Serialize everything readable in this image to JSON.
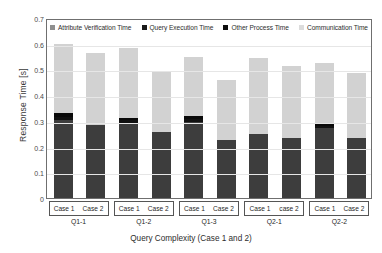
{
  "chart_data": {
    "type": "bar",
    "stacked": true,
    "title": "",
    "xlabel": "Query Complexity (Case 1 and 2)",
    "ylabel": "Response Time [s]",
    "ylim": [
      0,
      0.7
    ],
    "ytick_labels": [
      "0",
      "0.1",
      "0.2",
      "0.3",
      "0.4",
      "0.5",
      "0.6",
      "0.7"
    ],
    "ytick_values": [
      0,
      0.1,
      0.2,
      0.3,
      0.4,
      0.5,
      0.6,
      0.7
    ],
    "grid": true,
    "legend_position": "top-inside",
    "groups": [
      {
        "name": "Q1-1",
        "cases": [
          "Case 1",
          "Case 2"
        ]
      },
      {
        "name": "Q1-2",
        "cases": [
          "Case 1",
          "Case 2"
        ]
      },
      {
        "name": "Q1-3",
        "cases": [
          "Case 1",
          "Case 2"
        ]
      },
      {
        "name": "Q2-1",
        "cases": [
          "Case 1",
          "case 2"
        ]
      },
      {
        "name": "Q2-2",
        "cases": [
          "Case 1",
          "Case 2"
        ]
      }
    ],
    "categories": [
      "Q1-1 Case 1",
      "Q1-1 Case 2",
      "Q1-2 Case 1",
      "Q1-2 Case 2",
      "Q1-3 Case 1",
      "Q1-3 Case 2",
      "Q2-1 Case 1",
      "Q2-1 case 2",
      "Q2-2 Case 1",
      "Q2-2 Case 2"
    ],
    "series": [
      {
        "name": "Attribute Verification Time",
        "color": "#3d3d3d",
        "values": [
          0.305,
          0.285,
          0.292,
          0.255,
          0.295,
          0.225,
          0.25,
          0.235,
          0.272,
          0.235
        ]
      },
      {
        "name": "Query Execution Time",
        "color": "#111111",
        "values": [
          0.012,
          0.0,
          0.01,
          0.0,
          0.012,
          0.0,
          0.0,
          0.0,
          0.009,
          0.0
        ]
      },
      {
        "name": "Other Process Time",
        "color": "#0a0a0a",
        "values": [
          0.013,
          0.0,
          0.008,
          0.0,
          0.013,
          0.0,
          0.0,
          0.0,
          0.009,
          0.0
        ]
      },
      {
        "name": "Communication Time",
        "color": "#d2d2d2",
        "values": [
          0.27,
          0.28,
          0.275,
          0.235,
          0.23,
          0.235,
          0.295,
          0.28,
          0.235,
          0.25
        ]
      }
    ],
    "totals": [
      0.6,
      0.565,
      0.585,
      0.49,
      0.55,
      0.46,
      0.545,
      0.515,
      0.525,
      0.485
    ]
  },
  "legend": {
    "items": [
      {
        "label": "Attribute Verification Time",
        "color": "#8f8f8f"
      },
      {
        "label": "Query Execution Time",
        "color": "#1a1a1a"
      },
      {
        "label": "Other Process Time",
        "color": "#0d0d0d"
      },
      {
        "label": "Communication Time",
        "color": "#dcdcdc"
      }
    ]
  }
}
